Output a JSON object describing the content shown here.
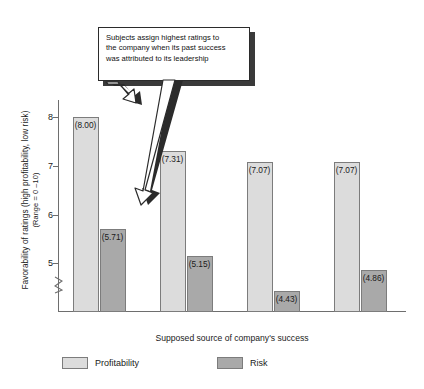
{
  "chart_data": {
    "type": "bar",
    "title": "",
    "subtitle": "",
    "xlabel": "Supposed source of company's success",
    "ylabel": "Favorability of ratings (high profitability, low risk)",
    "ylabel_line2": "(Range = 0 –10)",
    "categories": [
      "Leadership",
      "Employees",
      "Market",
      "Government"
    ],
    "series": [
      {
        "name": "Profitability",
        "color": "#dcdcdc",
        "values": [
          8.0,
          7.31,
          7.07,
          7.07
        ],
        "labels": [
          "(8.00)",
          "(7.31)",
          "(7.07)",
          "(7.07)"
        ]
      },
      {
        "name": "Risk",
        "color": "#a9a9a9",
        "values": [
          5.71,
          5.15,
          4.43,
          4.86
        ],
        "labels": [
          "(5.71)",
          "(5.15)",
          "(4.43)",
          "(4.86)"
        ]
      }
    ],
    "yticks": [
      5,
      6,
      7,
      8
    ],
    "ytick_labels": [
      "5",
      "6",
      "7",
      "8"
    ],
    "ylim": [
      4.0,
      8.35
    ],
    "axis_break": true,
    "grid": false,
    "legend_position": "bottom"
  },
  "annotation": {
    "text": "Subjects assign highest ratings to the company when its past success was attributed to its leadership",
    "lines": [
      "Subjects assign highest ratings to",
      "the company when its past success",
      "was attributed to its leadership"
    ],
    "arrow_count": 2,
    "arrow_targets": [
      "Leadership Profitability bar top",
      "Leadership Risk bar top"
    ]
  },
  "legend": {
    "items": [
      {
        "label": "Profitability",
        "color": "#dcdcdc"
      },
      {
        "label": "Risk",
        "color": "#a9a9a9"
      }
    ]
  },
  "colors": {
    "profitability": "#dcdcdc",
    "risk": "#a9a9a9",
    "axis": "#6e6e6e",
    "text": "#1a1a1a",
    "callout_border": "#2b2b2b",
    "callout_shadow": "#3a3a3a",
    "background": "#ffffff"
  }
}
